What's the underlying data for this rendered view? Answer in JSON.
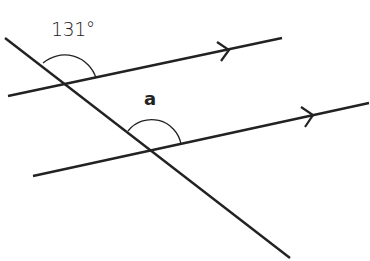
{
  "diagram": {
    "type": "parallel-lines-transversal",
    "labels": {
      "given_angle": "131°",
      "unknown_angle": "a"
    },
    "lines": {
      "parallel_upper": {
        "from": [
          8,
          96
        ],
        "to": [
          282,
          38
        ],
        "arrow_at": [
          228,
          50
        ]
      },
      "parallel_lower": {
        "from": [
          33,
          176
        ],
        "to": [
          369,
          103
        ],
        "arrow_at": [
          312,
          116
        ]
      },
      "transversal": {
        "from": [
          5,
          38
        ],
        "to": [
          290,
          258
        ]
      }
    },
    "colors": {
      "stroke": "#222222",
      "background": "#ffffff"
    }
  }
}
